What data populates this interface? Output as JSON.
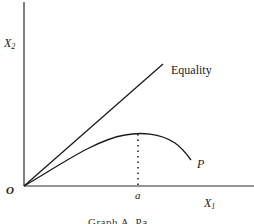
{
  "diagram": {
    "axes": {
      "y_label": "X",
      "y_label_sub": "2",
      "x_label": "X",
      "x_label_sub": "1",
      "origin_label": "O"
    },
    "lines": {
      "equality_label": "Equality",
      "curve_label": "P",
      "peak_marker_label": "a"
    },
    "caption": "Graph A. Pa",
    "colors": {
      "ink": "#1a1a1a",
      "background": "#ffffff"
    }
  }
}
